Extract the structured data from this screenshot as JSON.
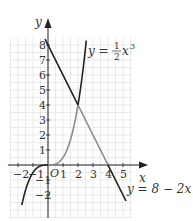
{
  "chart_data": {
    "type": "line",
    "title": "",
    "xlabel": "x",
    "ylabel": "y",
    "origin_label": "O",
    "xlim": [
      -2.5,
      5.5
    ],
    "ylim": [
      -3.5,
      9
    ],
    "grid": true,
    "x_ticks": [
      -2,
      -1,
      1,
      2,
      3,
      4,
      5
    ],
    "x_tick_labels": [
      "−2",
      "−1",
      "1",
      "2",
      "3",
      "4",
      "5"
    ],
    "y_ticks": [
      -2,
      -1,
      1,
      2,
      3,
      4,
      5,
      6,
      7,
      8
    ],
    "y_tick_labels": [
      "−2",
      "−1",
      "1",
      "2",
      "3",
      "4",
      "5",
      "6",
      "7",
      "8"
    ],
    "series": [
      {
        "name": "y = 1/2 x^3",
        "label_parts": {
          "lhs": "y =",
          "num": "1",
          "den": "2",
          "var": "x",
          "exp": "3"
        },
        "function": "0.5*x^3",
        "x_range": [
          -1.75,
          2.55
        ],
        "points": [
          [
            -1.75,
            -2.68
          ],
          [
            -1,
            -0.5
          ],
          [
            0,
            0
          ],
          [
            1,
            0.5
          ],
          [
            2,
            4
          ],
          [
            2.55,
            8.29
          ]
        ]
      },
      {
        "name": "y = 8 − 2x",
        "label": "y = 8 − 2x",
        "function": "8-2*x",
        "x_range": [
          -0.2,
          5.2
        ],
        "points": [
          [
            -0.2,
            8.4
          ],
          [
            0,
            8
          ],
          [
            2,
            4
          ],
          [
            4,
            0
          ],
          [
            5.2,
            -2.4
          ]
        ]
      }
    ],
    "intersection": [
      2,
      4
    ],
    "highlighted_region_note": "segments bounding region between curves and x-axis drawn in gray",
    "colors": {
      "curve": "#222222",
      "highlight": "#8a8a8a",
      "grid": "#dcdcdc",
      "axis": "#222222",
      "text": "#333333"
    }
  }
}
